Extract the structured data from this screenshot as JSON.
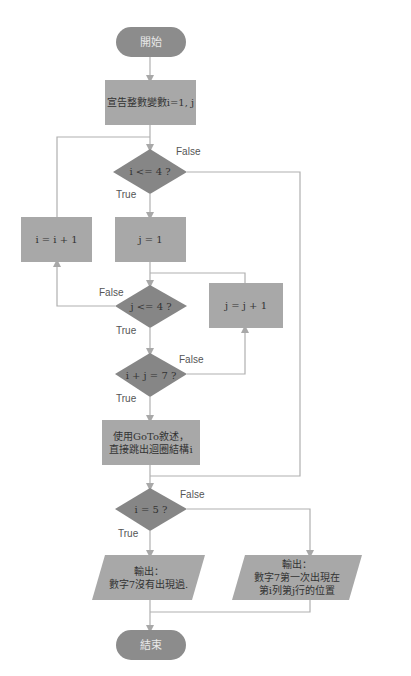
{
  "colors": {
    "terminal": "#8c8c8c",
    "process": "#a8a8a8",
    "decision": "#868686",
    "line": "#b0b0b0",
    "text": "#333333",
    "label": "#555555"
  },
  "nodes": {
    "start": {
      "type": "terminal",
      "text": "開始"
    },
    "declare": {
      "type": "process",
      "text": "宣告整數變數i=1, j"
    },
    "cond_i": {
      "type": "decision",
      "text": "i <= 4 ?"
    },
    "inc_i": {
      "type": "process",
      "text": "i = i + 1"
    },
    "init_j": {
      "type": "process",
      "text": "j = 1"
    },
    "cond_j": {
      "type": "decision",
      "text": "j <= 4 ?"
    },
    "inc_j": {
      "type": "process",
      "text": "j = j + 1"
    },
    "cond_sum": {
      "type": "decision",
      "text": "i + j = 7 ?"
    },
    "goto": {
      "type": "process",
      "line1": "使用GoTo敘述，",
      "line2": "直接跳出迴圈結構i"
    },
    "cond_i5": {
      "type": "decision",
      "text": "i = 5 ?"
    },
    "out_none": {
      "type": "io",
      "line1": "輸出：",
      "line2": "數字7沒有出現過."
    },
    "out_found": {
      "type": "io",
      "line1": "輸出：",
      "line2": "數字7第一次出現在",
      "line3": "第i列第j行的位置"
    },
    "end": {
      "type": "terminal",
      "text": "結束"
    }
  },
  "edge_labels": {
    "cond_i_false": "False",
    "cond_i_true": "True",
    "cond_j_false": "False",
    "cond_j_true": "True",
    "cond_sum_false": "False",
    "cond_sum_true": "True",
    "cond_i5_false": "False",
    "cond_i5_true": "True"
  }
}
